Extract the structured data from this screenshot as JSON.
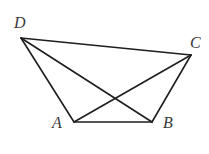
{
  "diagram": {
    "type": "geometry-quadrilateral",
    "points": {
      "D": {
        "x": 21,
        "y": 38,
        "label": "D",
        "lx": 14,
        "ly": 28
      },
      "C": {
        "x": 191,
        "y": 55,
        "label": "C",
        "lx": 190,
        "ly": 48
      },
      "A": {
        "x": 74,
        "y": 122,
        "label": "A",
        "lx": 52,
        "ly": 128
      },
      "B": {
        "x": 152,
        "y": 122,
        "label": "B",
        "lx": 163,
        "ly": 128
      }
    },
    "segments": [
      [
        "D",
        "C"
      ],
      [
        "D",
        "A"
      ],
      [
        "D",
        "B"
      ],
      [
        "A",
        "B"
      ],
      [
        "A",
        "C"
      ],
      [
        "B",
        "C"
      ]
    ],
    "line_color": "#1e1e1e",
    "label_color": "#3a3a3a"
  }
}
